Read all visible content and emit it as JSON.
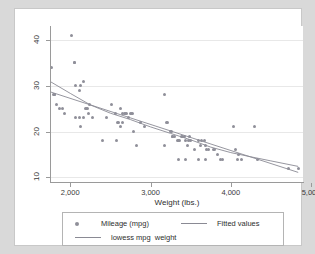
{
  "chart_data": {
    "type": "scatter",
    "title": "",
    "xlabel": "Weight (lbs.)",
    "ylabel": "",
    "xlim": [
      1760,
      4900
    ],
    "ylim": [
      9,
      43
    ],
    "xticks": [
      2000,
      3000,
      4000,
      5000
    ],
    "xticklabels": [
      "2,000",
      "3,000",
      "4,000",
      "5,000"
    ],
    "yticks": [
      10,
      20,
      30,
      40
    ],
    "yticklabels": [
      "10",
      "20",
      "30",
      "40"
    ],
    "grid": "horizontal",
    "legend_position": "below-plot",
    "series": [
      {
        "name": "Mileage (mpg)",
        "type": "scatter",
        "marker": "circle",
        "color": "#8f8f99",
        "points": [
          [
            1800,
            28
          ],
          [
            1800,
            28
          ],
          [
            1790,
            28
          ],
          [
            1760,
            34
          ],
          [
            1830,
            26
          ],
          [
            1870,
            25
          ],
          [
            1900,
            25
          ],
          [
            1930,
            24
          ],
          [
            2020,
            41
          ],
          [
            2050,
            35
          ],
          [
            2050,
            35
          ],
          [
            2070,
            30
          ],
          [
            2110,
            29
          ],
          [
            2130,
            30
          ],
          [
            2160,
            31
          ],
          [
            2190,
            25
          ],
          [
            2200,
            25
          ],
          [
            2210,
            25
          ],
          [
            2230,
            24
          ],
          [
            2160,
            23
          ],
          [
            2110,
            23
          ],
          [
            2070,
            23
          ],
          [
            2130,
            21
          ],
          [
            2240,
            26
          ],
          [
            2280,
            23
          ],
          [
            2400,
            18
          ],
          [
            2450,
            23
          ],
          [
            2520,
            26
          ],
          [
            2560,
            24
          ],
          [
            2590,
            22
          ],
          [
            2620,
            25
          ],
          [
            2650,
            24
          ],
          [
            2670,
            24
          ],
          [
            2690,
            24
          ],
          [
            2700,
            24
          ],
          [
            2650,
            22
          ],
          [
            2600,
            22
          ],
          [
            2580,
            18
          ],
          [
            2630,
            21
          ],
          [
            2730,
            23
          ],
          [
            2750,
            24
          ],
          [
            2760,
            24
          ],
          [
            2770,
            24
          ],
          [
            2790,
            20
          ],
          [
            2830,
            17
          ],
          [
            2880,
            22
          ],
          [
            2930,
            21
          ],
          [
            3170,
            28
          ],
          [
            3180,
            17
          ],
          [
            3200,
            22
          ],
          [
            3210,
            22
          ],
          [
            3250,
            20
          ],
          [
            3260,
            20
          ],
          [
            3270,
            19
          ],
          [
            3280,
            19
          ],
          [
            3300,
            19
          ],
          [
            3330,
            18
          ],
          [
            3350,
            18
          ],
          [
            3360,
            18
          ],
          [
            3380,
            19
          ],
          [
            3400,
            19
          ],
          [
            3420,
            19
          ],
          [
            3430,
            18
          ],
          [
            3460,
            17
          ],
          [
            3470,
            18
          ],
          [
            3480,
            19
          ],
          [
            3500,
            18
          ],
          [
            3550,
            16
          ],
          [
            3600,
            18
          ],
          [
            3620,
            17
          ],
          [
            3640,
            18
          ],
          [
            3670,
            18
          ],
          [
            3690,
            17
          ],
          [
            3700,
            16
          ],
          [
            3720,
            16
          ],
          [
            3350,
            14
          ],
          [
            3430,
            14
          ],
          [
            3600,
            14
          ],
          [
            3690,
            14
          ],
          [
            3780,
            16
          ],
          [
            3800,
            16
          ],
          [
            3830,
            15
          ],
          [
            3870,
            14
          ],
          [
            3900,
            14
          ],
          [
            4030,
            21
          ],
          [
            4060,
            16
          ],
          [
            4080,
            14
          ],
          [
            4100,
            15
          ],
          [
            4130,
            14
          ],
          [
            4290,
            21
          ],
          [
            4330,
            14
          ],
          [
            4720,
            12
          ],
          [
            4840,
            12
          ]
        ]
      },
      {
        "name": "Fitted values",
        "type": "line",
        "color": "#8a8a94",
        "endpoints": [
          [
            1760,
            28.6
          ],
          [
            4840,
            11.1
          ]
        ]
      },
      {
        "name": "lowess mpg  weight",
        "type": "line",
        "color": "#8a8a94",
        "points": [
          [
            1760,
            30.8
          ],
          [
            2000,
            28.3
          ],
          [
            2250,
            25.8
          ],
          [
            2500,
            24.0
          ],
          [
            2750,
            22.6
          ],
          [
            3000,
            21.0
          ],
          [
            3250,
            19.6
          ],
          [
            3500,
            18.2
          ],
          [
            3750,
            16.6
          ],
          [
            4000,
            15.4
          ],
          [
            4250,
            14.5
          ],
          [
            4500,
            13.6
          ],
          [
            4840,
            12.4
          ]
        ]
      }
    ]
  },
  "legend": {
    "entries": [
      {
        "label": "Mileage (mpg)",
        "marker": "circle-marker"
      },
      {
        "label": "Fitted values",
        "marker": "line-marker"
      },
      {
        "label": "lowess mpg  weight",
        "marker": "line-marker"
      }
    ]
  },
  "colors": {
    "marker": "#8f8f99",
    "line": "#8a8a94",
    "grid": "#e8e8e8",
    "axis": "#9a9a9a",
    "page_background": "#d9d9d9",
    "graph_background": "#ffffff"
  }
}
